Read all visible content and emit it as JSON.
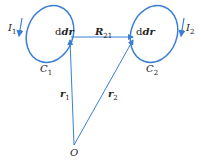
{
  "diagram": {
    "loop1": {
      "current": "I",
      "current_sub": "1",
      "curve": "C",
      "curve_sub": "1",
      "element": "dr",
      "element_sub": "1"
    },
    "loop2": {
      "current": "I",
      "current_sub": "2",
      "curve": "C",
      "curve_sub": "2",
      "element": "dr",
      "element_sub": "2"
    },
    "vector_R": {
      "label": "R",
      "sub": "21"
    },
    "vector_r1": {
      "label": "r",
      "sub": "1"
    },
    "vector_r2": {
      "label": "r",
      "sub": "2"
    },
    "origin": "O",
    "colors": {
      "line": "#3a7fd5",
      "text": "#222222"
    }
  }
}
